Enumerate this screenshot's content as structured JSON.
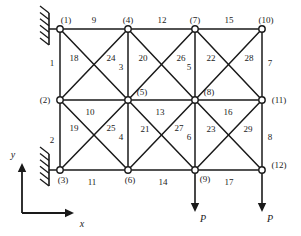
{
  "figure": {
    "geometry": {
      "width": 301,
      "height": 236,
      "node_radius": 3.2,
      "grid_x": [
        60,
        128,
        195,
        262
      ],
      "grid_y": [
        29,
        100,
        170
      ]
    },
    "colors": {
      "line": "#1a1a1a",
      "node_fill": "#ffffff",
      "text": "#1a1a1a",
      "background": "#ffffff"
    }
  },
  "chart_data": {
    "type": "diagram",
    "nodes": [
      {
        "id": "1",
        "label": "(1)",
        "x": 60,
        "y": 29,
        "label_dx": 6,
        "label_dy": -9
      },
      {
        "id": "2",
        "label": "(2)",
        "x": 60,
        "y": 100,
        "label_dx": -15,
        "label_dy": 0
      },
      {
        "id": "3",
        "label": "(3)",
        "x": 60,
        "y": 170,
        "label_dx": 3,
        "label_dy": 10
      },
      {
        "id": "4",
        "label": "(4)",
        "x": 128,
        "y": 29,
        "label_dx": 0,
        "label_dy": -9
      },
      {
        "id": "5",
        "label": "(5)",
        "x": 128,
        "y": 100,
        "label_dx": 14,
        "label_dy": -8
      },
      {
        "id": "6",
        "label": "(6)",
        "x": 128,
        "y": 170,
        "label_dx": 2,
        "label_dy": 10
      },
      {
        "id": "7",
        "label": "(7)",
        "x": 195,
        "y": 29,
        "label_dx": 0,
        "label_dy": -9
      },
      {
        "id": "8",
        "label": "(8)",
        "x": 195,
        "y": 100,
        "label_dx": 14,
        "label_dy": -8
      },
      {
        "id": "9",
        "label": "(9)",
        "x": 195,
        "y": 170,
        "label_dx": 10,
        "label_dy": 9
      },
      {
        "id": "10",
        "label": "(10)",
        "x": 262,
        "y": 29,
        "label_dx": 4,
        "label_dy": -9
      },
      {
        "id": "11",
        "label": "(11)",
        "x": 262,
        "y": 100,
        "label_dx": 17,
        "label_dy": 0
      },
      {
        "id": "12",
        "label": "(12)",
        "x": 262,
        "y": 170,
        "label_dx": 17,
        "label_dy": -5
      }
    ],
    "elements": [
      {
        "id": "1",
        "from": "1",
        "to": "2",
        "label_x": 52,
        "label_y": 63
      },
      {
        "id": "2",
        "from": "2",
        "to": "3",
        "label_x": 52,
        "label_y": 140
      },
      {
        "id": "3",
        "from": "4",
        "to": "5",
        "label_x": 121,
        "label_y": 67
      },
      {
        "id": "4",
        "from": "5",
        "to": "6",
        "label_x": 121,
        "label_y": 137
      },
      {
        "id": "5",
        "from": "7",
        "to": "8",
        "label_x": 189,
        "label_y": 67
      },
      {
        "id": "6",
        "from": "8",
        "to": "9",
        "label_x": 189,
        "label_y": 137
      },
      {
        "id": "7",
        "from": "10",
        "to": "11",
        "label_x": 270,
        "label_y": 63
      },
      {
        "id": "8",
        "from": "11",
        "to": "12",
        "label_x": 270,
        "label_y": 137
      },
      {
        "id": "9",
        "from": "1",
        "to": "4",
        "label_x": 94,
        "label_y": 20
      },
      {
        "id": "10",
        "from": "2",
        "to": "5",
        "label_x": 90,
        "label_y": 112
      },
      {
        "id": "11",
        "from": "3",
        "to": "6",
        "label_x": 92,
        "label_y": 182
      },
      {
        "id": "12",
        "from": "4",
        "to": "7",
        "label_x": 162,
        "label_y": 20
      },
      {
        "id": "13",
        "from": "5",
        "to": "8",
        "label_x": 160,
        "label_y": 112
      },
      {
        "id": "14",
        "from": "6",
        "to": "9",
        "label_x": 163,
        "label_y": 182
      },
      {
        "id": "15",
        "from": "7",
        "to": "10",
        "label_x": 229,
        "label_y": 20
      },
      {
        "id": "16",
        "from": "8",
        "to": "11",
        "label_x": 228,
        "label_y": 112
      },
      {
        "id": "17",
        "from": "9",
        "to": "12",
        "label_x": 229,
        "label_y": 182
      },
      {
        "id": "18",
        "from": "1",
        "to": "5",
        "label_x": 74,
        "label_y": 58
      },
      {
        "id": "19",
        "from": "2",
        "to": "6",
        "label_x": 74,
        "label_y": 128
      },
      {
        "id": "20",
        "from": "5",
        "to": "7",
        "label_x": 143,
        "label_y": 58
      },
      {
        "id": "21",
        "from": "5",
        "to": "9",
        "label_x": 145,
        "label_y": 129
      },
      {
        "id": "22",
        "from": "7",
        "to": "11",
        "label_x": 211,
        "label_y": 58
      },
      {
        "id": "23",
        "from": "8",
        "to": "12",
        "label_x": 211,
        "label_y": 129
      },
      {
        "id": "24",
        "from": "2",
        "to": "4",
        "label_x": 111,
        "label_y": 58
      },
      {
        "id": "25",
        "from": "3",
        "to": "5",
        "label_x": 111,
        "label_y": 128
      },
      {
        "id": "26",
        "from": "5",
        "to": "7",
        "label_x": 181,
        "label_y": 58
      },
      {
        "id": "27",
        "from": "6",
        "to": "8",
        "label_x": 179,
        "label_y": 128
      },
      {
        "id": "28",
        "from": "8",
        "to": "10",
        "label_x": 249,
        "label_y": 58
      },
      {
        "id": "29",
        "from": "9",
        "to": "11",
        "label_x": 248,
        "label_y": 129
      }
    ],
    "edges": [
      {
        "from": "1",
        "to": "4"
      },
      {
        "from": "4",
        "to": "7"
      },
      {
        "from": "7",
        "to": "10"
      },
      {
        "from": "2",
        "to": "5"
      },
      {
        "from": "5",
        "to": "8"
      },
      {
        "from": "8",
        "to": "11"
      },
      {
        "from": "3",
        "to": "6"
      },
      {
        "from": "6",
        "to": "9"
      },
      {
        "from": "9",
        "to": "12"
      },
      {
        "from": "1",
        "to": "2"
      },
      {
        "from": "2",
        "to": "3"
      },
      {
        "from": "4",
        "to": "5"
      },
      {
        "from": "5",
        "to": "6"
      },
      {
        "from": "7",
        "to": "8"
      },
      {
        "from": "8",
        "to": "9"
      },
      {
        "from": "10",
        "to": "11"
      },
      {
        "from": "11",
        "to": "12"
      },
      {
        "from": "1",
        "to": "5"
      },
      {
        "from": "2",
        "to": "4"
      },
      {
        "from": "4",
        "to": "8"
      },
      {
        "from": "5",
        "to": "7"
      },
      {
        "from": "7",
        "to": "11"
      },
      {
        "from": "8",
        "to": "10"
      },
      {
        "from": "2",
        "to": "6"
      },
      {
        "from": "3",
        "to": "5"
      },
      {
        "from": "5",
        "to": "9"
      },
      {
        "from": "6",
        "to": "8"
      },
      {
        "from": "8",
        "to": "12"
      },
      {
        "from": "9",
        "to": "11"
      }
    ],
    "supports": [
      {
        "node": "1",
        "type": "fixed-hatched",
        "x": 60,
        "y": 29
      },
      {
        "node": "3",
        "type": "fixed-hatched",
        "x": 60,
        "y": 170
      }
    ],
    "loads": [
      {
        "node": "9",
        "label": "P",
        "x": 195,
        "y": 170,
        "dir": "down",
        "length": 42
      },
      {
        "node": "12",
        "label": "P",
        "x": 262,
        "y": 170,
        "dir": "down",
        "length": 42
      }
    ],
    "axes": {
      "origin_x": 22,
      "origin_y": 213,
      "x_label": "x",
      "y_label": "y",
      "x_length": 52,
      "y_length": 50,
      "x_label_pos": {
        "x": 82,
        "y": 224
      },
      "y_label_pos": {
        "x": 13,
        "y": 155
      }
    }
  }
}
